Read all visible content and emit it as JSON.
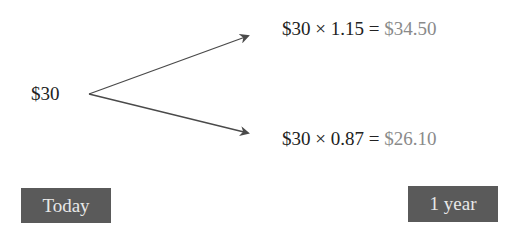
{
  "start_value": "$30",
  "outcomes": [
    {
      "expression": "$30 × 1.15 = ",
      "result": "$34.50"
    },
    {
      "expression": "$30 × 0.87 = ",
      "result": "$26.10"
    }
  ],
  "timeline": {
    "start_label": "Today",
    "end_label": "1 year"
  },
  "colors": {
    "arrow": "#4a4a4a",
    "label_box": "#5a5a5a",
    "result_text": "#8a8a8a"
  }
}
